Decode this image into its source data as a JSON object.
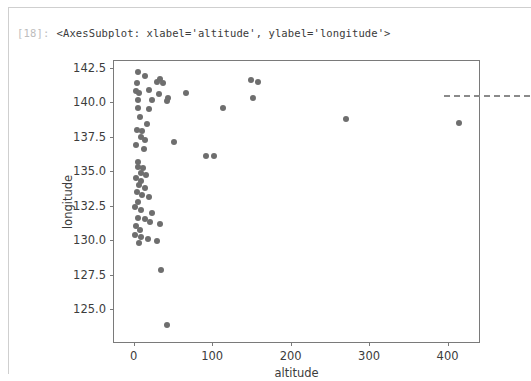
{
  "notebook": {
    "prompt_label": "[18]:",
    "output_text": "<AxesSubplot: xlabel='altitude', ylabel='longitude'>"
  },
  "colors": {
    "marker": "#6e6e6e",
    "axis": "#7a7a7a",
    "dashed_line": "#8a8a8a",
    "card_border": "#cfcfcf",
    "prompt": "#bdbdbd",
    "text": "#3c3c3c"
  },
  "chart_data": {
    "type": "scatter",
    "title": "",
    "xlabel": "altitude",
    "ylabel": "longitude",
    "xlim": [
      -25,
      440
    ],
    "ylim": [
      122.6,
      143.0
    ],
    "xticks": [
      0,
      100,
      200,
      300,
      400
    ],
    "xtick_labels": [
      "0",
      "100",
      "200",
      "300",
      "400"
    ],
    "yticks": [
      125.0,
      127.5,
      130.0,
      132.5,
      135.0,
      137.5,
      140.0,
      142.5
    ],
    "ytick_labels": [
      "125.0",
      "127.5",
      "130.0",
      "132.5",
      "135.0",
      "137.5",
      "140.0",
      "142.5"
    ],
    "grid": false,
    "legend": null,
    "marker_color": "#6e6e6e",
    "marker_size": 6,
    "annotations": [
      {
        "type": "hline",
        "y": 140.5,
        "x_start": 395,
        "x_end": 505,
        "style": "dashed",
        "color": "#8a8a8a",
        "extends_beyond_axes": true
      }
    ],
    "points": [
      {
        "x": 5,
        "y": 142.2
      },
      {
        "x": 14,
        "y": 141.9
      },
      {
        "x": 30,
        "y": 141.5
      },
      {
        "x": 34,
        "y": 141.7
      },
      {
        "x": 37,
        "y": 141.4
      },
      {
        "x": 150,
        "y": 141.6
      },
      {
        "x": 158,
        "y": 141.5
      },
      {
        "x": 4,
        "y": 141.4
      },
      {
        "x": 3,
        "y": 140.8
      },
      {
        "x": 7,
        "y": 140.7
      },
      {
        "x": 20,
        "y": 140.9
      },
      {
        "x": 32,
        "y": 140.6
      },
      {
        "x": 44,
        "y": 140.3
      },
      {
        "x": 67,
        "y": 140.7
      },
      {
        "x": 6,
        "y": 140.2
      },
      {
        "x": 24,
        "y": 140.2
      },
      {
        "x": 42,
        "y": 140.1
      },
      {
        "x": 152,
        "y": 140.3
      },
      {
        "x": 5,
        "y": 139.6
      },
      {
        "x": 20,
        "y": 139.5
      },
      {
        "x": 114,
        "y": 139.6
      },
      {
        "x": 271,
        "y": 138.8
      },
      {
        "x": 414,
        "y": 138.5
      },
      {
        "x": 8,
        "y": 138.9
      },
      {
        "x": 17,
        "y": 138.4
      },
      {
        "x": 4,
        "y": 138.0
      },
      {
        "x": 11,
        "y": 137.9
      },
      {
        "x": 9,
        "y": 137.5
      },
      {
        "x": 15,
        "y": 137.3
      },
      {
        "x": 52,
        "y": 137.1
      },
      {
        "x": 3,
        "y": 136.9
      },
      {
        "x": 13,
        "y": 136.6
      },
      {
        "x": 92,
        "y": 136.1
      },
      {
        "x": 102,
        "y": 136.1
      },
      {
        "x": 5,
        "y": 135.7
      },
      {
        "x": 6,
        "y": 135.3
      },
      {
        "x": 12,
        "y": 135.2
      },
      {
        "x": 9,
        "y": 134.9
      },
      {
        "x": 16,
        "y": 134.7
      },
      {
        "x": 3,
        "y": 134.5
      },
      {
        "x": 10,
        "y": 134.3
      },
      {
        "x": 7,
        "y": 134.0
      },
      {
        "x": 14,
        "y": 133.8
      },
      {
        "x": 4,
        "y": 133.5
      },
      {
        "x": 11,
        "y": 133.3
      },
      {
        "x": 20,
        "y": 133.1
      },
      {
        "x": 6,
        "y": 132.8
      },
      {
        "x": 2,
        "y": 132.4
      },
      {
        "x": 9,
        "y": 132.2
      },
      {
        "x": 24,
        "y": 132.0
      },
      {
        "x": 5,
        "y": 131.6
      },
      {
        "x": 14,
        "y": 131.5
      },
      {
        "x": 21,
        "y": 131.3
      },
      {
        "x": 34,
        "y": 131.2
      },
      {
        "x": 3,
        "y": 131.0
      },
      {
        "x": 8,
        "y": 130.7
      },
      {
        "x": 2,
        "y": 130.4
      },
      {
        "x": 10,
        "y": 130.2
      },
      {
        "x": 18,
        "y": 130.1
      },
      {
        "x": 30,
        "y": 129.9
      },
      {
        "x": 7,
        "y": 129.8
      },
      {
        "x": 35,
        "y": 127.8
      },
      {
        "x": 42,
        "y": 123.8
      }
    ]
  }
}
